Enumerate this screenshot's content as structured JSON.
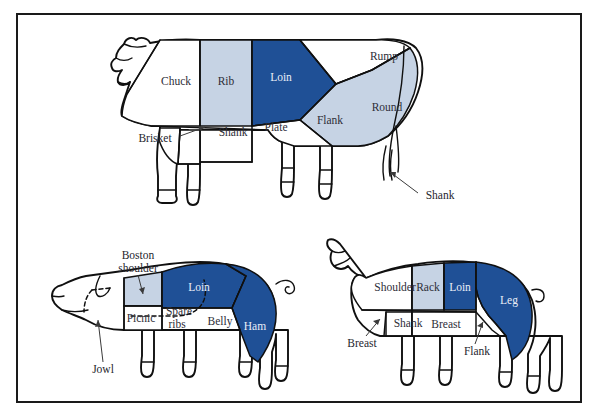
{
  "figure": {
    "frame_color": "#1a1a1a",
    "background": "#ffffff"
  },
  "palette": {
    "dark_blue": "#1f5096",
    "light_blue": "#c6d3e4",
    "white": "#ffffff",
    "outline": "#101010",
    "label_text": "#2e2e38",
    "label_text_on_blue": "#e9eef6"
  },
  "animals": [
    {
      "name": "beef",
      "labels": {
        "chuck": "Chuck",
        "rib": "Rib",
        "loin": "Loin",
        "rump": "Rump",
        "round": "Round",
        "flank": "Flank",
        "plate": "Plate",
        "shank_front": "Shank",
        "brisket": "Brisket",
        "shank_rear": "Shank"
      },
      "cuts": [
        {
          "label": "Chuck",
          "fill": "#ffffff"
        },
        {
          "label": "Rib",
          "fill": "#c6d3e4"
        },
        {
          "label": "Loin",
          "fill": "#1f5096"
        },
        {
          "label": "Rump",
          "fill": "#ffffff"
        },
        {
          "label": "Round",
          "fill": "#c6d3e4"
        },
        {
          "label": "Flank",
          "fill": "#ffffff"
        },
        {
          "label": "Plate",
          "fill": "#ffffff"
        },
        {
          "label": "Shank",
          "fill": "#ffffff"
        },
        {
          "label": "Brisket",
          "fill": "#ffffff"
        }
      ]
    },
    {
      "name": "pork",
      "labels": {
        "boston_shoulder": "Boston",
        "boston_shoulder_line2": "shoulder",
        "loin": "Loin",
        "ham": "Ham",
        "picnic": "Picnic",
        "spare_ribs": "Spare",
        "spare_ribs_line2": "ribs",
        "belly": "Belly",
        "jowl": "Jowl"
      },
      "cuts": [
        {
          "label": "Boston shoulder",
          "fill": "#c6d3e4"
        },
        {
          "label": "Loin",
          "fill": "#1f5096"
        },
        {
          "label": "Ham",
          "fill": "#1f5096"
        },
        {
          "label": "Picnic",
          "fill": "#ffffff"
        },
        {
          "label": "Spare ribs",
          "fill": "#ffffff"
        },
        {
          "label": "Belly",
          "fill": "#ffffff"
        },
        {
          "label": "Jowl",
          "fill": "#ffffff"
        }
      ]
    },
    {
      "name": "lamb",
      "labels": {
        "shoulder": "Shoulder",
        "rack": "Rack",
        "loin": "Loin",
        "leg": "Leg",
        "shank": "Shank",
        "breast_mid": "Breast",
        "breast_front": "Breast",
        "flank": "Flank"
      },
      "cuts": [
        {
          "label": "Shoulder",
          "fill": "#ffffff"
        },
        {
          "label": "Rack",
          "fill": "#c6d3e4"
        },
        {
          "label": "Loin",
          "fill": "#1f5096"
        },
        {
          "label": "Leg",
          "fill": "#1f5096"
        },
        {
          "label": "Shank",
          "fill": "#ffffff"
        },
        {
          "label": "Breast",
          "fill": "#ffffff"
        },
        {
          "label": "Flank",
          "fill": "#ffffff"
        }
      ]
    }
  ]
}
